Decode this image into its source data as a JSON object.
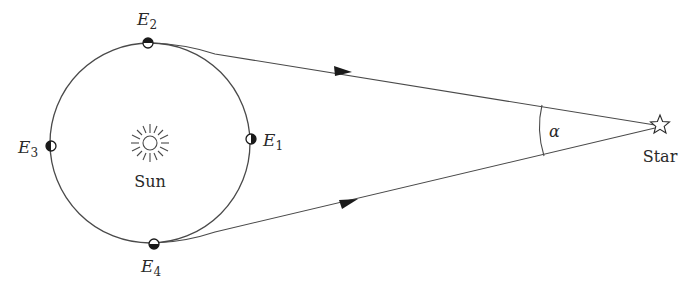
{
  "diagram": {
    "colors": {
      "stroke": "#4a4a4a",
      "fill_dark": "#1a1a1a",
      "text": "#2a2a2a",
      "background": "#ffffff"
    },
    "sun": {
      "label": "Sun",
      "icon": "sun-icon"
    },
    "star": {
      "label": "Star",
      "icon": "star-outline-icon"
    },
    "angle": {
      "label": "α"
    },
    "earth_positions": [
      {
        "id": "E1",
        "base": "E",
        "sub": "1",
        "position": "right"
      },
      {
        "id": "E2",
        "base": "E",
        "sub": "2",
        "position": "top"
      },
      {
        "id": "E3",
        "base": "E",
        "sub": "3",
        "position": "left"
      },
      {
        "id": "E4",
        "base": "E",
        "sub": "4",
        "position": "bottom"
      }
    ],
    "sight_lines": [
      {
        "from": "E2",
        "to": "Star",
        "arrow": "toward-star"
      },
      {
        "from": "E4",
        "to": "Star",
        "arrow": "toward-star"
      }
    ]
  }
}
